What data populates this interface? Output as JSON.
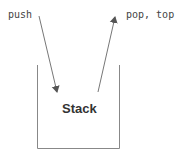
{
  "diagram": {
    "push_label": "push",
    "pop_label": "pop, top",
    "container_label": "Stack",
    "colors": {
      "line": "#777777",
      "text": "#444444",
      "background": "#ffffff"
    }
  }
}
